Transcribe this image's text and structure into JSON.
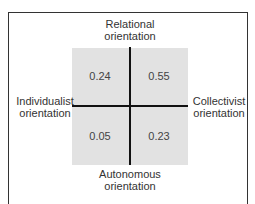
{
  "diagram": {
    "axes": {
      "top": {
        "line1": "Relational",
        "line2": "orientation"
      },
      "bottom": {
        "line1": "Autonomous",
        "line2": "orientation"
      },
      "left": {
        "line1": "Individualist",
        "line2": "orientation"
      },
      "right": {
        "line1": "Collectivist",
        "line2": "orientation"
      }
    },
    "quadrants": {
      "top_left": "0.24",
      "top_right": "0.55",
      "bottom_left": "0.05",
      "bottom_right": "0.23"
    },
    "colors": {
      "grid_fill": "#e2e2e2",
      "axis_line": "#111111",
      "frame": "#333333"
    }
  }
}
